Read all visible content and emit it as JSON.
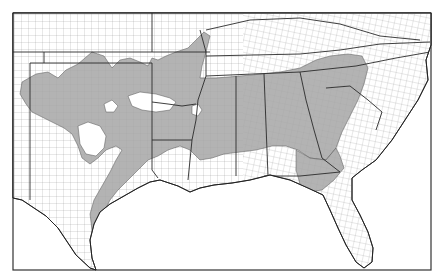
{
  "map": {
    "title": "",
    "region": "Southeastern United States",
    "description": "County-level map with shaded distribution area",
    "colors": {
      "shaded": "#a6a6a6",
      "background": "#ffffff",
      "border": "#333333"
    },
    "legend": []
  }
}
